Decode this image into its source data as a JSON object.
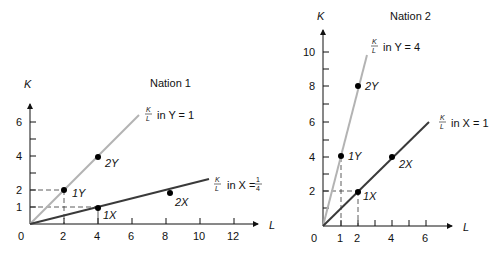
{
  "panels": [
    {
      "title": "Nation 1",
      "y_axis_label": "K",
      "x_axis_label": "L",
      "origin_label": "0",
      "x_ticks": [
        "2",
        "4",
        "6",
        "8",
        "10",
        "12"
      ],
      "y_ticks": [
        "1",
        "2",
        "4",
        "6"
      ],
      "line_Y": {
        "frac_num": "K",
        "frac_den": "L",
        "text": "in Y = 1"
      },
      "line_X": {
        "frac_num": "K",
        "frac_den": "L",
        "text_pre": "in X = ",
        "val_num": "1",
        "val_den": "4"
      },
      "points": [
        {
          "label": "1Y",
          "L": 2,
          "K": 2
        },
        {
          "label": "2Y",
          "L": 4,
          "K": 4
        },
        {
          "label": "1X",
          "L": 4,
          "K": 1
        },
        {
          "label": "2X",
          "L": 8,
          "K": 2
        }
      ]
    },
    {
      "title": "Nation 2",
      "y_axis_label": "K",
      "x_axis_label": "L",
      "origin_label": "0",
      "x_ticks": [
        "1",
        "2",
        "4",
        "6"
      ],
      "y_ticks": [
        "2",
        "4",
        "6",
        "8",
        "10"
      ],
      "line_Y": {
        "frac_num": "K",
        "frac_den": "L",
        "text": "in Y = 4"
      },
      "line_X": {
        "frac_num": "K",
        "frac_den": "L",
        "text": "in X = 1"
      },
      "points": [
        {
          "label": "1Y",
          "L": 1,
          "K": 4
        },
        {
          "label": "2Y",
          "L": 2,
          "K": 8
        },
        {
          "label": "1X",
          "L": 2,
          "K": 2
        },
        {
          "label": "2X",
          "L": 4,
          "K": 4
        }
      ]
    }
  ],
  "colors": {
    "axis": "#111111",
    "line_Y": "#b3b3b3",
    "line_X": "#3a3a3a",
    "point": "#000000"
  }
}
